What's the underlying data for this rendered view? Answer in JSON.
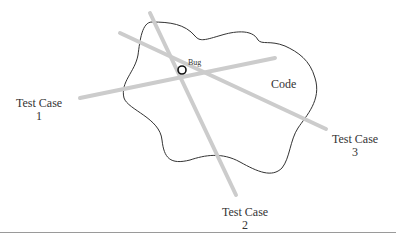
{
  "diagram": {
    "region_label": "Code",
    "bug_label": "Bug",
    "test_cases": [
      {
        "title": "Test Case",
        "number": "1"
      },
      {
        "title": "Test Case",
        "number": "2"
      },
      {
        "title": "Test Case",
        "number": "3"
      }
    ],
    "colors": {
      "test_line": "#cccccc",
      "outline": "#333333",
      "bug": "#111111"
    }
  }
}
